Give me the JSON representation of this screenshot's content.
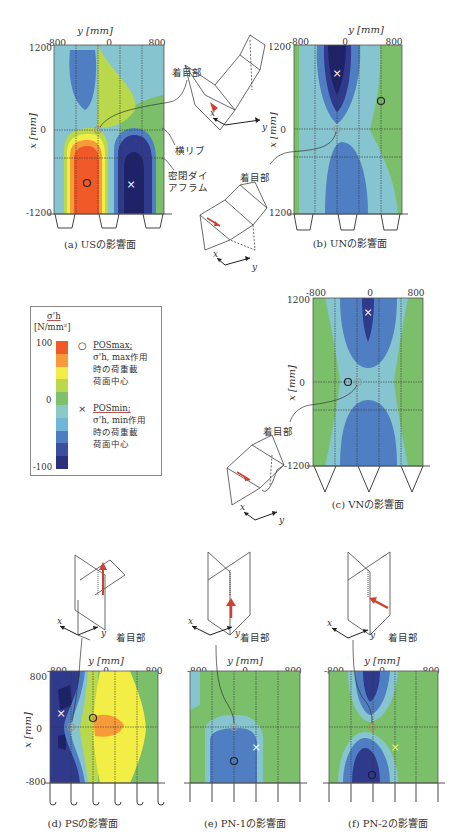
{
  "figure": {
    "colors": {
      "levels": [
        {
          "value": 100,
          "color": "#f05a28"
        },
        {
          "value": 80,
          "color": "#f79a3a"
        },
        {
          "value": 60,
          "color": "#f3ee45"
        },
        {
          "value": 40,
          "color": "#b9d84b"
        },
        {
          "value": 20,
          "color": "#7fc06b"
        },
        {
          "value": 0,
          "color": "#8cc8c8"
        },
        {
          "value": -20,
          "color": "#6fb6d8"
        },
        {
          "value": -40,
          "color": "#4d7ec0"
        },
        {
          "value": -60,
          "color": "#3c4f9e"
        },
        {
          "value": -80,
          "color": "#2a2f7e"
        },
        {
          "value": -100,
          "color": "#1f2468"
        }
      ],
      "green": "#7bbf6a",
      "lightblue": "#86c4cf",
      "midblue": "#4f7fc2",
      "darkblue": "#2f3a8c",
      "navy": "#1e2266",
      "orange": "#f05a28",
      "lightorange": "#f79a3a",
      "yellow": "#f3ee45",
      "yellowgreen": "#b9d84b",
      "arrow": "#d04030"
    }
  },
  "legend": {
    "title": "σ'h",
    "unit": "[N/mm²]",
    "ticks": [
      "100",
      "0",
      "-100"
    ],
    "max_symbol": "○",
    "max_label": "POSmax;",
    "max_desc_1": "σ'h, max作用",
    "max_desc_2": "時の荷重載",
    "max_desc_3": "荷面中心",
    "min_symbol": "×",
    "min_label": "POSmin;",
    "min_desc_1": "σ'h, min作用",
    "min_desc_2": "時の荷重載",
    "min_desc_3": "荷面中心"
  },
  "panels": {
    "a": {
      "caption": "(a) USの影響面",
      "y_axis_title": "y [mm]",
      "x_axis_title": "x [mm]",
      "y_ticks": [
        "-800",
        "0",
        "800"
      ],
      "x_ticks": [
        "1200",
        "0",
        "-1200"
      ],
      "annot_focus": "着目部",
      "annot_rib": "横リブ",
      "annot_diaphragm_1": "密閉ダイ",
      "annot_diaphragm_2": "アフラム"
    },
    "b": {
      "caption": "(b) UNの影響面",
      "y_axis_title": "y [mm]",
      "x_axis_title": "x [mm]",
      "y_ticks": [
        "-800",
        "0",
        "800"
      ],
      "x_ticks": [
        "1200",
        "0",
        "-1200"
      ],
      "annot_focus": "着目部"
    },
    "c": {
      "caption": "(c) VNの影響面",
      "x_axis_title": "x [mm]",
      "y_ticks": [
        "-800",
        "0",
        "800"
      ],
      "x_ticks": [
        "1200",
        "0",
        "-1200"
      ],
      "annot_focus": "着目部"
    },
    "d": {
      "caption": "(d) PSの影響面",
      "y_axis_title": "y [mm]",
      "x_axis_title": "x [mm]",
      "y_ticks": [
        "-800",
        "0",
        "800"
      ],
      "x_ticks": [
        "800",
        "0",
        "-800"
      ],
      "annot_focus": "着目部"
    },
    "e": {
      "caption": "(e) PN-1の影響面",
      "y_axis_title": "y [mm]",
      "y_ticks": [
        "-800",
        "0",
        "800"
      ],
      "annot_focus": "着目部"
    },
    "f": {
      "caption": "(f) PN-2の影響面",
      "y_axis_title": "y [mm]",
      "y_ticks": [
        "-800",
        "0",
        "800"
      ],
      "annot_focus": "着目部"
    }
  },
  "axis_letters": {
    "x": "x",
    "y": "y"
  }
}
